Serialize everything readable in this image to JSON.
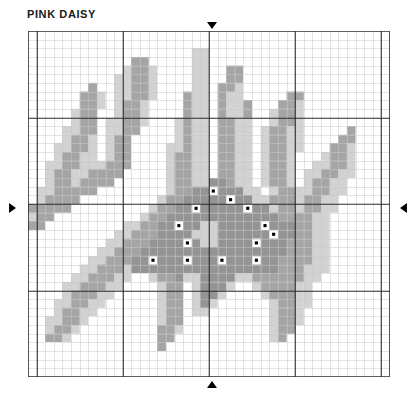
{
  "title": "PINK DAISY",
  "chart_data": {
    "type": "heatmap",
    "title": "PINK DAISY",
    "grid": {
      "columns": 42,
      "rows": 40,
      "cell_px": 8.62,
      "bold_line_every": 10,
      "grid_on": true,
      "light_line_color": "#c9c9c9",
      "bold_line_color": "#2b2b2b"
    },
    "legend": [
      {
        "key": ".",
        "symbol": "blank",
        "name": "background",
        "color": "#ffffff"
      },
      {
        "key": "l",
        "symbol": "light-fill",
        "name": "light pink petal",
        "color": "#d2d2d2"
      },
      {
        "key": "m",
        "symbol": "mid-fill",
        "name": "medium pink petal",
        "color": "#a5a5a5"
      },
      {
        "key": "d",
        "symbol": "dark-fill",
        "name": "dark center",
        "color": "#949494"
      },
      {
        "key": "k",
        "symbol": "square-dot",
        "name": "french knot accent",
        "color": "#ffffff",
        "dot_color": "#000000"
      }
    ],
    "markers": [
      {
        "name": "center-marker-top",
        "glyph": "triangle-down",
        "edge": "top",
        "column": 21
      },
      {
        "name": "center-marker-bottom",
        "glyph": "triangle-up",
        "edge": "bottom",
        "column": 21
      },
      {
        "name": "center-marker-left",
        "glyph": "triangle-right",
        "edge": "left",
        "row": 20
      },
      {
        "name": "center-marker-right",
        "glyph": "triangle-left",
        "edge": "right",
        "row": 20
      }
    ],
    "xlabel": "",
    "ylabel": "",
    "rows_encoded": [
      "..........................................",
      "..........................................",
      "...................ll.....................",
      "............mm.....ll.....................",
      "...........lmml....ll..mm.................",
      "..........llmml....ll..mm.................",
      ".......m..llmml....ll.mml.................",
      "......mml.llmml...mll.mll.....mm..........",
      "......mml.lmml....mll.mllm...mml..........",
      ".....lmm..lmml....mll.mllm..lmml..........",
      ".....lmm.llmml...lmll.mmll..lmml..........",
      "....llmm.llmm....lmll.mmll.lmmll.....m....",
      "....lmml.lmm.....lmll.mmll.lmmll....mm....",
      "...llmml.lmm....llmll.mmll.lmmll...mml....",
      "...lmmll.lmm....lmmll.mmll.lmml...lmml....",
      "..llmmlllmmm....lmmll.mmll.lmml..llmml....",
      "..lmmllmmmm.....lmmll.mmll.lmml.llmmll....",
      "..lmmlmmmm......lmmllddmll.lmml.lmmll.....",
      ".llmmmmm........lmmddkdddll.lmmllmmll.....",
      ".lmmmm.........lmmdddddkddllmmmlmmll......",
      "mmmmm.........lmmddkdddddkddlmmlmmll......",
      "lmm..........lmmdddddddddddddmmmmll.......",
      "mm.........llmmddkddlldddddkdddmmll.......",
      "..........llmmmddddlllddddddkddmmll.......",
      ".........llmmmddddkdllddddkdddmmmll.......",
      "........llmmmdddddddddddddddddmmmll......",
      ".......llmmmddkdddkdddkdddkddmmmmll......",
      "......llmmmldddddddddddddddddmmmlll......",
      ".....llmmmll..lmmdllddddllmmmmmmll.......",
      "....llmmmll....lmm.ldddl..lmmmmll........",
      "....lmmmll.....lmm.lddl....lmmmll........",
      "...llmmll......lmm.ldl......lmmll........",
      "...lmmll.......lmm.ll.......lmml.........",
      "..llmml........lmm..........lmml.........",
      "..lmml.........mml..........lmm..........",
      "..mml..........mm...........lm...........",
      "...............m..........................",
      "..........................................",
      "..........................................",
      ".........................................."
    ]
  }
}
